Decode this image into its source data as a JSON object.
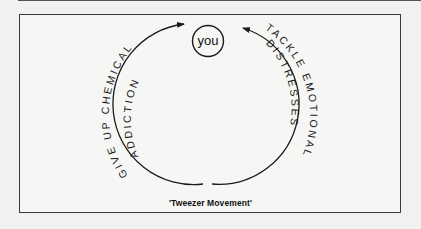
{
  "diagram": {
    "center_node": {
      "label": "you"
    },
    "left_path": {
      "outer_text": "GIVE UP CHEMICAL",
      "inner_text": "ADDICTION",
      "direction": "upward toward you"
    },
    "right_path": {
      "outer_text": "TACKLE EMOTIONAL",
      "inner_text": "DISTRESSES",
      "direction": "upward toward you"
    },
    "caption": "'Tweezer Movement'"
  },
  "colors": {
    "background": "#f1f1ef",
    "stroke": "#1a1a1a"
  }
}
